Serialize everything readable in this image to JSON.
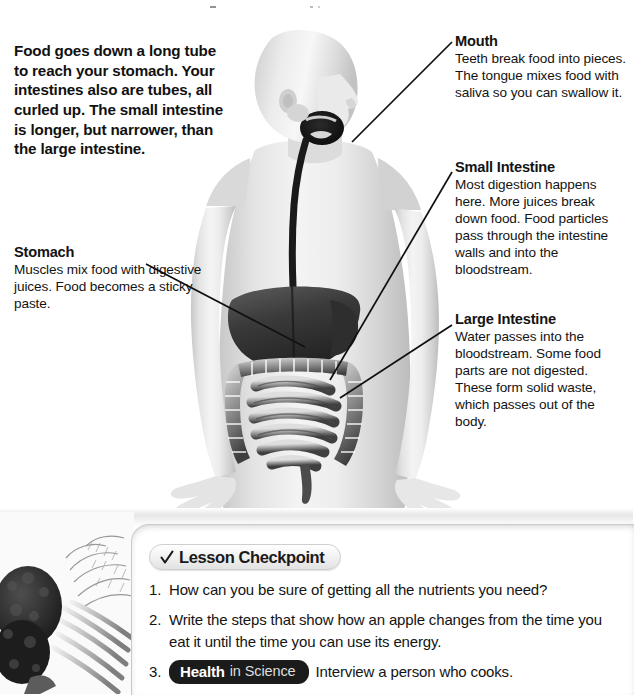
{
  "page": {
    "background_color": "#ffffff",
    "text_color": "#111111"
  },
  "intro": {
    "text": "Food goes down a long tube to reach your stomach. Your intestines also are tubes, all curled up. The small intestine is longer, but narrower, than the large intestine."
  },
  "callouts": [
    {
      "id": "mouth",
      "title": "Mouth",
      "body": "Teeth break food into pieces. The tongue mixes food with saliva so you can swallow it."
    },
    {
      "id": "small-intestine",
      "title": "Small Intestine",
      "body": "Most digestion happens here. More juices break down food. Food particles pass through the intestine walls and into the bloodstream."
    },
    {
      "id": "large-intestine",
      "title": "Large Intestine",
      "body": "Water passes into the bloodstream. Some food parts are not digested. These form solid waste, which passes out of the body."
    },
    {
      "id": "stomach",
      "title": "Stomach",
      "body": "Muscles mix food with digestive juices. Food becomes a sticky paste."
    }
  ],
  "illustration": {
    "description": "Grayscale human figure with digestive system organs",
    "alt_labels": [
      "head-and-neck",
      "esophagus-tube",
      "liver",
      "stomach-organ",
      "small-intestine-organ",
      "large-intestine-organ"
    ],
    "leader_lines": [
      {
        "name": "mouth-leader-line",
        "x1": 352,
        "y1": 142,
        "x2": 452,
        "y2": 42
      },
      {
        "name": "small-intestine-leader-line",
        "x1": 330,
        "y1": 380,
        "x2": 452,
        "y2": 172
      },
      {
        "name": "large-intestine-leader-line",
        "x1": 340,
        "y1": 398,
        "x2": 452,
        "y2": 325
      },
      {
        "name": "stomach-leader-line",
        "x1": 146,
        "y1": 264,
        "x2": 305,
        "y2": 347
      }
    ]
  },
  "checkpoint": {
    "pill_label": "Lesson Checkpoint",
    "check_icon": "checkmark-icon",
    "items": [
      {
        "number": "1.",
        "text": "How can you be sure of getting all the nutrients you need?"
      },
      {
        "number": "2.",
        "text": "Write the steps that show how an apple changes from the time you eat it until the time you can use its energy."
      },
      {
        "number": "3.",
        "badge_strong": "Health",
        "badge_light": "in Science",
        "text": "Interview a person who cooks."
      }
    ]
  },
  "photo": {
    "name": "vegetables-photo",
    "description": "Broccoli and carrot greens"
  }
}
